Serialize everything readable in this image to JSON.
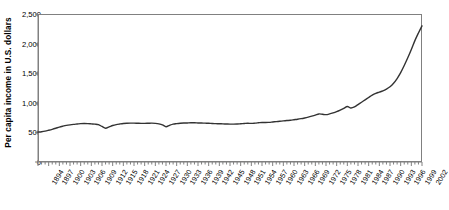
{
  "chart_data": {
    "type": "line",
    "title": "",
    "subtitle": "",
    "xlabel": "",
    "ylabel": "Per capita income in U.S. dollars",
    "xlim": [
      1894,
      2002
    ],
    "ylim": [
      0,
      2500
    ],
    "grid": false,
    "legend": null,
    "legend_position": "none",
    "line_color": "#333333",
    "axis_color": "#808080",
    "y_ticks": [
      0,
      500,
      1000,
      1500,
      2000,
      2500
    ],
    "y_tick_labels": [
      "0",
      "500",
      "1,000",
      "1,500",
      "2,000",
      "2,500"
    ],
    "x_tick_labels": [
      "1894",
      "1897",
      "1900",
      "1903",
      "1906",
      "1909",
      "1912",
      "1915",
      "1918",
      "1921",
      "1924",
      "1927",
      "1930",
      "1933",
      "1936",
      "1939",
      "1942",
      "1945",
      "1948",
      "1951",
      "1954",
      "1957",
      "1960",
      "1963",
      "1966",
      "1969",
      "1972",
      "1975",
      "1978",
      "1981",
      "1984",
      "1987",
      "1990",
      "1993",
      "1996",
      "1999",
      "2002"
    ],
    "x_tick_interval_years": 3,
    "x_minor_tick_interval_years": 1,
    "series": [
      {
        "name": "Per capita income",
        "x": [
          1894,
          1895,
          1896,
          1897,
          1898,
          1899,
          1900,
          1901,
          1902,
          1903,
          1904,
          1905,
          1906,
          1907,
          1908,
          1909,
          1910,
          1911,
          1912,
          1913,
          1914,
          1915,
          1916,
          1917,
          1918,
          1919,
          1920,
          1921,
          1922,
          1923,
          1924,
          1925,
          1926,
          1927,
          1928,
          1929,
          1930,
          1931,
          1932,
          1933,
          1934,
          1935,
          1936,
          1937,
          1938,
          1939,
          1940,
          1941,
          1942,
          1943,
          1944,
          1945,
          1946,
          1947,
          1948,
          1949,
          1950,
          1951,
          1952,
          1953,
          1954,
          1955,
          1956,
          1957,
          1958,
          1959,
          1960,
          1961,
          1962,
          1963,
          1964,
          1965,
          1966,
          1967,
          1968,
          1969,
          1970,
          1971,
          1972,
          1973,
          1974,
          1975,
          1976,
          1977,
          1978,
          1979,
          1980,
          1981,
          1982,
          1983,
          1984,
          1985,
          1986,
          1987,
          1988,
          1989,
          1990,
          1991,
          1992,
          1993,
          1994,
          1995,
          1996,
          1997,
          1998,
          1999,
          2000,
          2001,
          2002
        ],
        "values": [
          505,
          512,
          522,
          536,
          552,
          570,
          590,
          605,
          618,
          628,
          636,
          642,
          648,
          650,
          648,
          644,
          640,
          632,
          600,
          570,
          592,
          616,
          632,
          642,
          650,
          654,
          656,
          656,
          654,
          652,
          652,
          654,
          656,
          652,
          644,
          628,
          596,
          620,
          640,
          648,
          654,
          658,
          660,
          662,
          662,
          660,
          658,
          656,
          654,
          650,
          648,
          646,
          644,
          642,
          640,
          640,
          642,
          646,
          650,
          654,
          652,
          656,
          662,
          668,
          666,
          670,
          676,
          682,
          688,
          694,
          700,
          706,
          714,
          722,
          732,
          744,
          758,
          774,
          792,
          812,
          806,
          800,
          812,
          830,
          852,
          878,
          906,
          938,
          912,
          930,
          970,
          1010,
          1050,
          1090,
          1130,
          1160,
          1180,
          1200,
          1230,
          1270,
          1330,
          1410,
          1510,
          1630,
          1760,
          1900,
          2050,
          2180,
          2300
        ]
      }
    ],
    "annotations": []
  },
  "figure": {
    "plot_left_px": 38,
    "plot_top_px": 14,
    "plot_width_px": 384,
    "plot_height_px": 148
  }
}
